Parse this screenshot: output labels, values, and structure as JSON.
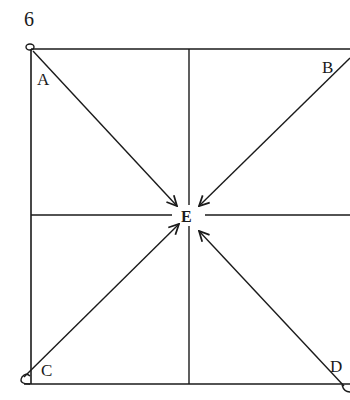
{
  "figure": {
    "number": "6",
    "center_label": "E",
    "corner_labels": {
      "top_left": "A",
      "top_right": "B",
      "bottom_left": "C",
      "bottom_right": "D"
    },
    "line_color": "#1a1a1a",
    "background": "#ffffff"
  }
}
